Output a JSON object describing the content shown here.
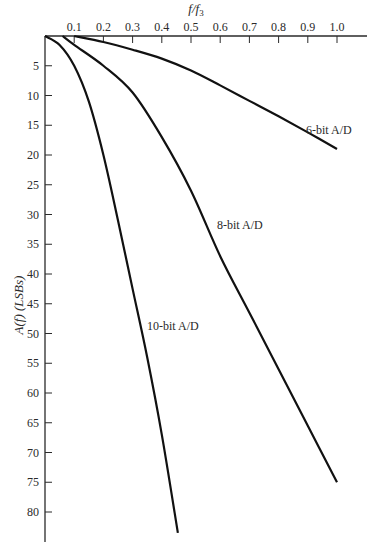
{
  "chart_data": {
    "type": "line",
    "title": "",
    "xlabel": "f/f3",
    "ylabel": "A(f) (LSBs)",
    "xlim": [
      0,
      1.1
    ],
    "ylim": [
      0,
      85
    ],
    "y_inverted": true,
    "x_axis_position": "top",
    "grid": false,
    "x_ticks": [
      "0.1",
      "0.2",
      "0.3",
      "0.4",
      "0.5",
      "0.6",
      "0.7",
      "0.8",
      "0.9",
      "1.0"
    ],
    "y_ticks": [
      "5",
      "10",
      "15",
      "20",
      "25",
      "30",
      "35",
      "40",
      "45",
      "50",
      "55",
      "60",
      "65",
      "70",
      "75",
      "80"
    ],
    "series": [
      {
        "name": "6-bit A/D",
        "x": [
          0.1,
          0.2,
          0.3,
          0.4,
          0.5,
          0.6,
          0.7,
          0.8,
          0.9,
          1.0
        ],
        "values": [
          0,
          1.0,
          2.3,
          3.8,
          5.8,
          8.3,
          10.9,
          13.5,
          16.2,
          19.0
        ]
      },
      {
        "name": "8-bit A/D",
        "x": [
          0.06,
          0.1,
          0.2,
          0.3,
          0.4,
          0.5,
          0.6,
          0.7,
          0.8,
          0.9,
          1.0
        ],
        "values": [
          0,
          1.5,
          5.0,
          9.5,
          17.0,
          26.0,
          37.0,
          46.5,
          56.0,
          65.5,
          75.0
        ]
      },
      {
        "name": "10-bit A/D",
        "x": [
          0,
          0.05,
          0.1,
          0.15,
          0.2,
          0.25,
          0.3,
          0.35,
          0.4,
          0.455
        ],
        "values": [
          0,
          1.5,
          5.0,
          11.0,
          20.0,
          31.0,
          42.5,
          54.0,
          67.0,
          83.5
        ]
      }
    ],
    "annotations": [
      {
        "text": "6-bit A/D",
        "x": 0.97,
        "y": 16
      },
      {
        "text": "8-bit A/D",
        "x": 0.62,
        "y": 32
      },
      {
        "text": "10-bit A/D",
        "x": 0.36,
        "y": 49
      }
    ]
  },
  "labels": {
    "x_axis_title": "f/f",
    "x_axis_sub": "3",
    "y_axis_title": "A(f) (LSBs)",
    "series_6": "6-bit A/D",
    "series_8": "8-bit A/D",
    "series_10": "10-bit A/D"
  }
}
